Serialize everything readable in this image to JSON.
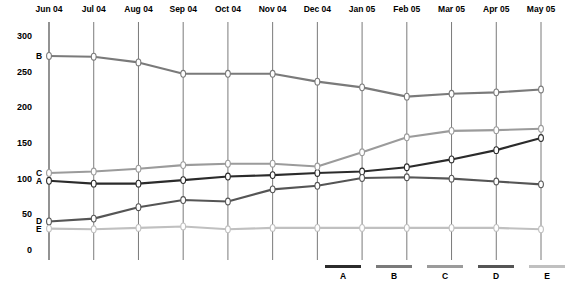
{
  "title_fragment": "",
  "axes": {
    "y_ticks": [
      0,
      50,
      100,
      150,
      200,
      250,
      300
    ],
    "ylim": [
      0,
      300
    ],
    "x_categories": [
      "Jun 04",
      "Jul 04",
      "Aug 04",
      "Sep 04",
      "Oct 04",
      "Nov 04",
      "Dec 04",
      "Jan 05",
      "Feb 05",
      "Mar 05",
      "Apr 05",
      "May 05"
    ]
  },
  "series_tags": [
    {
      "label": "B",
      "value": 272
    },
    {
      "label": "C",
      "value": 108
    },
    {
      "label": "A",
      "value": 97
    },
    {
      "label": "D",
      "value": 40
    },
    {
      "label": "E",
      "value": 30
    }
  ],
  "legend": {
    "entries": [
      {
        "label": "A",
        "color": "#2b2b2b"
      },
      {
        "label": "B",
        "color": "#7a7a7a"
      },
      {
        "label": "C",
        "color": "#9b9b9b"
      },
      {
        "label": "D",
        "color": "#555555"
      },
      {
        "label": "E",
        "color": "#c0c0c0"
      }
    ]
  },
  "colors": {
    "grid": "#6b6b6b",
    "axis": "#4a4a4a",
    "marker_fill": "#ffffff",
    "background": "#ffffff"
  },
  "chart_data": {
    "type": "line",
    "title": "",
    "xlabel": "",
    "ylabel": "",
    "ylim": [
      0,
      300
    ],
    "grid": true,
    "legend_position": "bottom-right",
    "categories": [
      "Jun 04",
      "Jul 04",
      "Aug 04",
      "Sep 04",
      "Oct 04",
      "Nov 04",
      "Dec 04",
      "Jan 05",
      "Feb 05",
      "Mar 05",
      "Apr 05",
      "May 05"
    ],
    "series": [
      {
        "name": "A",
        "color": "#2b2b2b",
        "values": [
          97,
          93,
          93,
          98,
          103,
          105,
          108,
          110,
          116,
          127,
          140,
          157
        ]
      },
      {
        "name": "B",
        "color": "#7a7a7a",
        "values": [
          272,
          271,
          263,
          247,
          247,
          247,
          236,
          228,
          215,
          219,
          221,
          225
        ]
      },
      {
        "name": "C",
        "color": "#9b9b9b",
        "values": [
          108,
          110,
          114,
          119,
          121,
          121,
          117,
          137,
          158,
          167,
          168,
          170
        ]
      },
      {
        "name": "D",
        "color": "#555555",
        "values": [
          40,
          44,
          60,
          70,
          68,
          85,
          90,
          101,
          102,
          100,
          96,
          92
        ]
      },
      {
        "name": "E",
        "color": "#c0c0c0",
        "values": [
          30,
          29,
          31,
          33,
          29,
          31,
          31,
          31,
          31,
          31,
          31,
          29
        ]
      }
    ]
  }
}
